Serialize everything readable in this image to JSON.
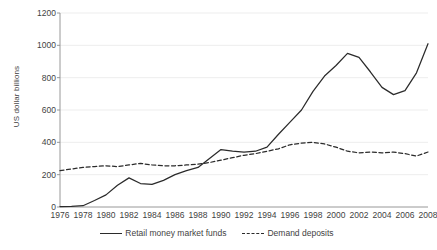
{
  "chart_data": {
    "type": "line",
    "title": "",
    "xlabel": "",
    "ylabel": "US dollar billions",
    "ylim": [
      0,
      1200
    ],
    "ytick_values": [
      0,
      200,
      400,
      600,
      800,
      1000,
      1200
    ],
    "ytick_labels": [
      "0",
      "200",
      "400",
      "600",
      "800",
      "1000",
      "1200"
    ],
    "xlim": [
      1976,
      2008
    ],
    "xtick_values": [
      1976,
      1978,
      1980,
      1982,
      1984,
      1986,
      1988,
      1990,
      1992,
      1994,
      1996,
      1998,
      2000,
      2002,
      2004,
      2006,
      2008
    ],
    "xtick_labels": [
      "1976",
      "1978",
      "1980",
      "1982",
      "1984",
      "1986",
      "1988",
      "1990",
      "1992",
      "1994",
      "1996",
      "1998",
      "2000",
      "2002",
      "2004",
      "2006",
      "2008"
    ],
    "grid": true,
    "grid_axis": "y",
    "legend_position": "bottom",
    "x": [
      1976,
      1977,
      1978,
      1979,
      1980,
      1981,
      1982,
      1983,
      1984,
      1985,
      1986,
      1987,
      1988,
      1989,
      1990,
      1991,
      1992,
      1993,
      1994,
      1995,
      1996,
      1997,
      1998,
      1999,
      2000,
      2001,
      2002,
      2003,
      2004,
      2005,
      2006,
      2007,
      2008
    ],
    "series": [
      {
        "name": "Retail money market funds",
        "style": "solid",
        "color": "#2b2b2b",
        "values": [
          3,
          4,
          8,
          40,
          75,
          135,
          180,
          145,
          140,
          165,
          200,
          225,
          245,
          300,
          355,
          345,
          340,
          345,
          370,
          450,
          525,
          600,
          715,
          810,
          875,
          950,
          925,
          835,
          740,
          695,
          720,
          830,
          1010
        ]
      },
      {
        "name": "Demand deposits",
        "style": "dashed",
        "color": "#2b2b2b",
        "values": [
          225,
          235,
          245,
          250,
          255,
          250,
          260,
          270,
          260,
          255,
          255,
          260,
          265,
          275,
          290,
          305,
          320,
          330,
          345,
          360,
          385,
          395,
          400,
          390,
          370,
          345,
          335,
          340,
          335,
          340,
          330,
          315,
          340
        ]
      }
    ]
  }
}
